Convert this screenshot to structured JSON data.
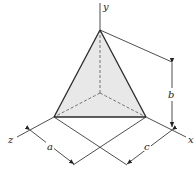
{
  "diagram": {
    "type": "tetrahedron-with-axes",
    "axes": {
      "y_label": "y",
      "x_label": "x",
      "z_label": "z"
    },
    "dimensions": {
      "a_label": "a",
      "b_label": "b",
      "c_label": "c"
    },
    "colors": {
      "face_fill": "#e8e8e8",
      "line": "#2a2a2a"
    }
  }
}
